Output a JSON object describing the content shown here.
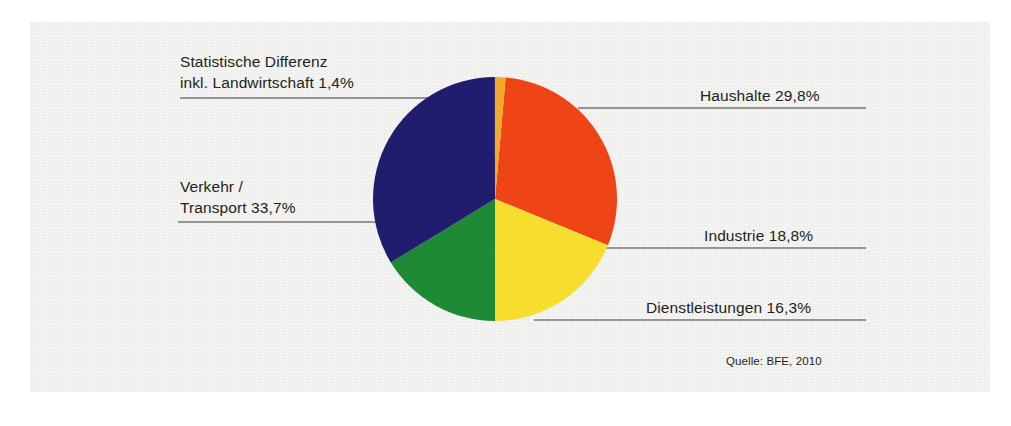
{
  "figure": {
    "background_color": "#f4f4f2",
    "page_color": "#ffffff",
    "text_color": "#231f20"
  },
  "source_note": "Quelle: BFE, 2010",
  "labels": {
    "statistische_differenz_line1": "Statistische Differenz",
    "statistische_differenz_line2": "inkl. Landwirtschaft 1,4%",
    "haushalte": "Haushalte 29,8%",
    "verkehr_line1": "Verkehr /",
    "verkehr_line2": "Transport 33,7%",
    "industrie": "Industrie 18,8%",
    "dienstleistungen": "Dienstleistungen 16,3%"
  },
  "chart_data": {
    "type": "pie",
    "title": "",
    "subtitle": "",
    "xlabel": "",
    "ylabel": "",
    "grid": false,
    "legend_position": "callout-labels",
    "units": "%",
    "total": 100.0,
    "start_angle_deg": 5,
    "direction": "clockwise",
    "center": {
      "x": 495,
      "y": 199
    },
    "radius": 122,
    "categories": [
      "Verkehr / Transport",
      "Haushalte",
      "Industrie",
      "Dienstleistungen",
      "Statistische Differenz inkl. Landwirtschaft"
    ],
    "values": [
      33.7,
      29.8,
      18.8,
      16.3,
      1.4
    ],
    "colors": [
      "#201c6e",
      "#ef4416",
      "#f7de2e",
      "#1e8a36",
      "#f0a92a"
    ],
    "slices": [
      {
        "name": "Haushalte",
        "value": 29.8,
        "label": "Haushalte 29,8%",
        "color": "#ef4416"
      },
      {
        "name": "Industrie",
        "value": 18.8,
        "label": "Industrie 18,8%",
        "color": "#f7de2e"
      },
      {
        "name": "Dienstleistungen",
        "value": 16.3,
        "label": "Dienstleistungen 16,3%",
        "color": "#1e8a36"
      },
      {
        "name": "Verkehr / Transport",
        "value": 33.7,
        "label": "Verkehr / Transport 33,7%",
        "color": "#201c6e"
      },
      {
        "name": "Statistische Differenz inkl. Landwirtschaft",
        "value": 1.4,
        "label": "Statistische Differenz inkl. Landwirtschaft 1,4%",
        "color": "#f0a92a"
      }
    ],
    "annotations": [
      "Quelle: BFE, 2010"
    ]
  }
}
